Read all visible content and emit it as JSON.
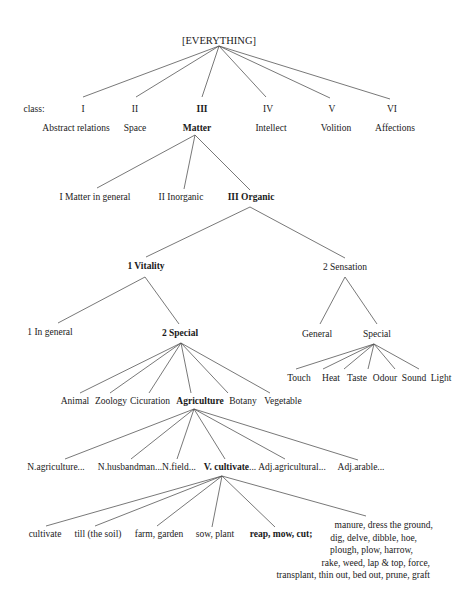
{
  "root": {
    "label": "[EVERYTHING]"
  },
  "classes": {
    "prefix": "class:",
    "items": [
      {
        "numeral": "I",
        "name": "Abstract relations",
        "bold": false
      },
      {
        "numeral": "II",
        "name": "Space",
        "bold": false
      },
      {
        "numeral": "III",
        "name": "Matter",
        "bold": true
      },
      {
        "numeral": "IV",
        "name": "Intellect",
        "bold": false
      },
      {
        "numeral": "V",
        "name": "Volition",
        "bold": false
      },
      {
        "numeral": "VI",
        "name": "Affections",
        "bold": false
      }
    ]
  },
  "matter": {
    "children": [
      "I Matter in general",
      "II Inorganic",
      "III Organic"
    ]
  },
  "organic": {
    "children": [
      "1 Vitality",
      "2 Sensation"
    ]
  },
  "vitality": {
    "children": [
      "1 In general",
      "2 Special"
    ]
  },
  "sensation": {
    "children": [
      "General",
      "Special"
    ],
    "special_children": [
      "Touch",
      "Heat",
      "Taste",
      "Odour",
      "Sound",
      "Light"
    ]
  },
  "special": {
    "children": [
      "Animal",
      "Zoology",
      "Cicuration",
      "Agriculture",
      "Botany",
      "Vegetable"
    ]
  },
  "agriculture": {
    "children": [
      "N.agriculture...",
      "N.husbandman...",
      "N.field...",
      "V. cultivate",
      "Adj.agricultural...",
      "Adj.arable..."
    ],
    "v_cultivate_suffix": "..."
  },
  "cultivate": {
    "children": [
      "cultivate",
      "till (the soil)",
      "farm, garden",
      "sow, plant",
      "reap, mow, cut;"
    ],
    "last_block": [
      "manure, dress the ground,",
      "dig, delve, dibble, hoe,",
      "plough, plow, harrow,",
      "rake, weed, lap & top, force,",
      "transplant, thin out, bed out, prune, graft"
    ]
  }
}
